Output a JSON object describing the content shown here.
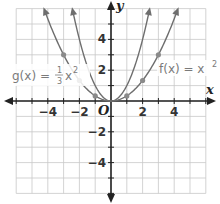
{
  "chart_data": {
    "type": "line",
    "title": "",
    "xlabel": "x",
    "ylabel": "y",
    "xlim": [
      -6,
      6
    ],
    "ylim": [
      -6,
      6
    ],
    "grid": true,
    "x_ticks": [
      -4,
      -2,
      2,
      4
    ],
    "y_ticks": [
      4,
      2,
      -2,
      -4
    ],
    "origin_label": "O",
    "series": [
      {
        "name": "f(x) = x²",
        "label_main": "f(x) = x",
        "label_exp": "2",
        "formula": "x^2",
        "points": []
      },
      {
        "name": "g(x) = ⅓x²",
        "label_main": "g(x) = ",
        "label_frac_num": "1",
        "label_frac_den": "3",
        "label_var": "x",
        "label_exp": "2",
        "formula": "(1/3)x^2",
        "points": [
          [
            -3,
            3
          ],
          [
            -2,
            1.33
          ],
          [
            -1,
            0.33
          ],
          [
            1,
            0.33
          ],
          [
            2,
            1.33
          ],
          [
            3,
            3
          ]
        ]
      }
    ]
  },
  "colors": {
    "curve": "#6e6e6e",
    "grid": "#c8c8c8",
    "axis": "#222222",
    "point": "#8a8a8a"
  }
}
